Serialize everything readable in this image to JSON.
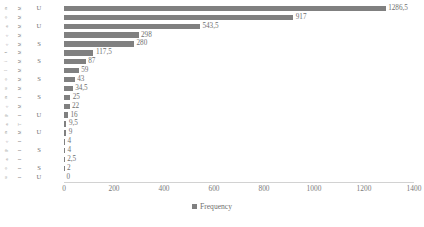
{
  "chart_data": {
    "type": "bar",
    "orientation": "horizontal",
    "title": "",
    "xlabel": "",
    "ylabel": "",
    "xlim": [
      0,
      1400
    ],
    "xticks": [
      0,
      200,
      400,
      600,
      800,
      1000,
      1200,
      1400
    ],
    "grid": false,
    "legend": {
      "position": "bottom-center",
      "entries": [
        {
          "name": "Frequency",
          "color": "#808080"
        }
      ]
    },
    "series": [
      {
        "name": "Frequency",
        "color": "#808080",
        "values": [
          1286.5,
          917,
          543.5,
          298,
          280,
          117.5,
          87,
          59,
          43,
          34.5,
          25,
          22,
          16,
          9.5,
          9,
          4,
          4,
          2.5,
          2,
          0
        ]
      }
    ],
    "value_labels": [
      "1286,5",
      "917",
      "543,5",
      "298",
      "280",
      "117,5",
      "87",
      "59",
      "43",
      "34,5",
      "25",
      "22",
      "16",
      "9,5",
      "9",
      "4",
      "4",
      "2,5",
      "2",
      "0"
    ],
    "categories": [
      {
        "col_a": "n",
        "col_b": "M",
        "code": "U"
      },
      {
        "col_a": "o",
        "col_b": "M",
        "code": ""
      },
      {
        "col_a": "a",
        "col_b": "M",
        "code": "U"
      },
      {
        "col_a": "e",
        "col_b": "M",
        "code": ""
      },
      {
        "col_a": "e",
        "col_b": "M",
        "code": "S"
      },
      {
        "col_a": "t",
        "col_b": "M",
        "code": ""
      },
      {
        "col_a": "i",
        "col_b": "M",
        "code": "S"
      },
      {
        "col_a": "l",
        "col_b": "M",
        "code": ""
      },
      {
        "col_a": "o",
        "col_b": "M",
        "code": "S"
      },
      {
        "col_a": "u",
        "col_b": "M",
        "code": ""
      },
      {
        "col_a": "n",
        "col_b": "I",
        "code": "S"
      },
      {
        "col_a": "e",
        "col_b": "M",
        "code": ""
      },
      {
        "col_a": "p",
        "col_b": "I",
        "code": "U"
      },
      {
        "col_a": "a",
        "col_b": "T",
        "code": ""
      },
      {
        "col_a": "n",
        "col_b": "M",
        "code": "U"
      },
      {
        "col_a": "e",
        "col_b": "I",
        "code": ""
      },
      {
        "col_a": "p",
        "col_b": "I",
        "code": "S"
      },
      {
        "col_a": "a",
        "col_b": "I",
        "code": ""
      },
      {
        "col_a": "o",
        "col_b": "I",
        "code": "S"
      },
      {
        "col_a": "u",
        "col_b": "I",
        "code": "U"
      }
    ]
  }
}
